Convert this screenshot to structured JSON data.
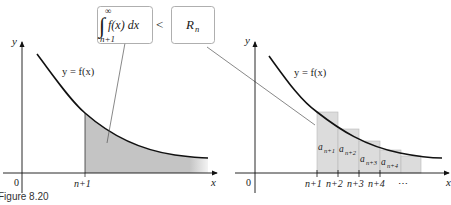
{
  "figure": {
    "caption": "Figure 8.20",
    "left_panel": {
      "y_axis_label": "y",
      "x_axis_label": "x",
      "origin_label": "0",
      "curve_label": "y = f(x)",
      "tick_label": "n+1",
      "shaded_region": "area under f(x) from n+1 to infinity"
    },
    "right_panel": {
      "y_axis_label": "y",
      "x_axis_label": "x",
      "origin_label": "0",
      "curve_label": "y = f(x)",
      "tick_labels": [
        "n+1",
        "n+2",
        "n+3",
        "n+4",
        "⋯"
      ],
      "bar_labels": [
        "a",
        "a",
        "a",
        "a"
      ],
      "bar_subscripts": [
        "n+1",
        "n+2",
        "n+3",
        "n+4"
      ]
    },
    "callouts": {
      "integral": {
        "sign": "∫",
        "upper_limit": "∞",
        "lower_limit": "n+1",
        "integrand": "f(x) dx"
      },
      "relation": "<",
      "remainder": {
        "symbol": "R",
        "subscript": "n"
      }
    },
    "colors": {
      "shade": "#c8c8c8",
      "bar_fill": "#dcdcdc",
      "bar_stroke": "#b4b4b4",
      "curve": "#111111",
      "box_stroke": "#9a9a9a"
    }
  }
}
